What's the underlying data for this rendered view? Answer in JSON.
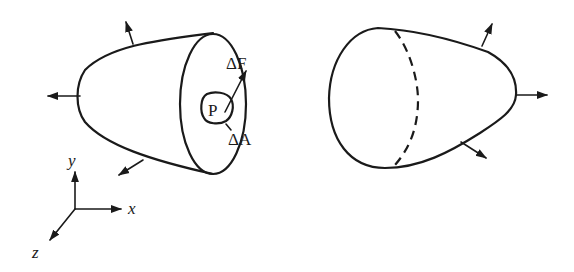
{
  "figure": {
    "left_body": {
      "point_label": "P",
      "force_label": "ΔF",
      "area_label": "ΔA"
    },
    "axes": {
      "x_label": "x",
      "y_label": "y",
      "z_label": "z"
    },
    "colors": {
      "ink": "#1a1a1a",
      "background": "#ffffff"
    }
  }
}
